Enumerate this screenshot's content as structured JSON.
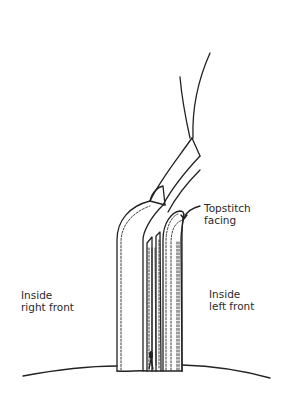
{
  "figure": {
    "colors": {
      "line": "#222222",
      "background": "#ffffff",
      "text": "#2a2a2a"
    }
  },
  "labels": {
    "topstitch": {
      "line1": "Topstitch",
      "line2": "facing"
    },
    "right_front": {
      "line1": "Inside",
      "line2": "right front"
    },
    "left_front": {
      "line1": "Inside",
      "line2": "left front"
    }
  }
}
